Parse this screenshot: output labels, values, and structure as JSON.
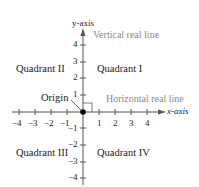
{
  "diagram": {
    "y_axis_label": "y-axis",
    "x_axis_label": "x-axis",
    "vertical_line_label": "Vertical real line",
    "horizontal_line_label": "Horizontal real line",
    "origin_label": "Origin",
    "quadrants": {
      "q1": "Quadrant I",
      "q2": "Quadrant II",
      "q3": "Quadrant III",
      "q4": "Quadrant IV"
    },
    "x_ticks": [
      "−4",
      "−3",
      "−2",
      "−1",
      "1",
      "2",
      "3",
      "4"
    ],
    "y_ticks": [
      "4",
      "3",
      "2",
      "1",
      "−1",
      "−2",
      "−3",
      "−4"
    ],
    "colors": {
      "axis": "#555555",
      "annotation": "#8a8a8a",
      "text": "#1a1a1a"
    }
  }
}
